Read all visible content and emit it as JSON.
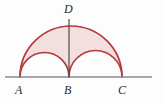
{
  "figure": {
    "background_color": "#fdfdfd",
    "baseline": {
      "name": "horizontal-axis",
      "color": "#8a8a8a",
      "x_start": 5,
      "x_end": 152,
      "y": 77,
      "stroke_width": 1.4
    },
    "shaded_region": {
      "fill_color": "#f2d9d9",
      "fill_opacity": 0.85,
      "stroke_color": "#b23b3b",
      "stroke_width": 1.6
    },
    "arcs": [
      {
        "name": "large-semicircle-AC",
        "from": "A",
        "to": "C",
        "center_x": 71,
        "radius": 51,
        "apex_y": 18
      },
      {
        "name": "small-semicircle-AB",
        "from": "A",
        "to": "B",
        "center_x": 44.5,
        "radius": 24.5,
        "apex_y": 52
      },
      {
        "name": "medium-semicircle-BC",
        "from": "B",
        "to": "C",
        "center_x": 95.5,
        "radius": 26.5,
        "apex_y": 50
      }
    ],
    "segment_BD": {
      "name": "vertical-segment-B-to-D",
      "color": "#4a4a4a",
      "x": 69,
      "y_top": 19,
      "y_bottom": 77,
      "stroke_width": 1.2
    },
    "points": [
      {
        "id": "A",
        "label": "A",
        "x": 20,
        "y": 77
      },
      {
        "id": "B",
        "label": "B",
        "x": 69,
        "y": 77
      },
      {
        "id": "C",
        "label": "C",
        "x": 122,
        "y": 77
      },
      {
        "id": "D",
        "label": "D",
        "x": 69,
        "y": 19
      }
    ]
  }
}
